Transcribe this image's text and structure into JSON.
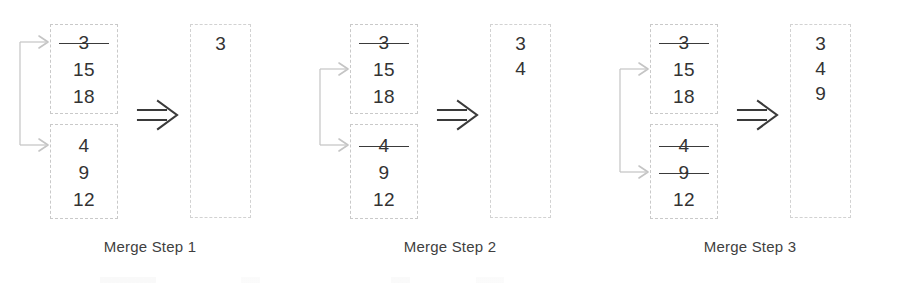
{
  "figure": {
    "colors": {
      "box_border": "#c9c9c9",
      "text": "#333333",
      "pointer": "#bdbdbd",
      "merge_arrow": "#3a3a3a",
      "caption": "#3f3f3f"
    }
  },
  "panels": [
    {
      "caption": "Merge Step 1",
      "top_stack": {
        "cells": [
          {
            "value": "3",
            "struck": true
          },
          {
            "value": "15",
            "struck": false
          },
          {
            "value": "18",
            "struck": false
          }
        ],
        "pointer_row": 0
      },
      "bottom_stack": {
        "cells": [
          {
            "value": "4",
            "struck": false
          },
          {
            "value": "9",
            "struck": false
          },
          {
            "value": "12",
            "struck": false
          }
        ],
        "pointer_row": 0
      },
      "output": {
        "cells": [
          "3"
        ]
      },
      "merge_arrow": "double-right-arrow"
    },
    {
      "caption": "Merge Step 2",
      "top_stack": {
        "cells": [
          {
            "value": "3",
            "struck": true
          },
          {
            "value": "15",
            "struck": false
          },
          {
            "value": "18",
            "struck": false
          }
        ],
        "pointer_row": 1
      },
      "bottom_stack": {
        "cells": [
          {
            "value": "4",
            "struck": true
          },
          {
            "value": "9",
            "struck": false
          },
          {
            "value": "12",
            "struck": false
          }
        ],
        "pointer_row": 0
      },
      "output": {
        "cells": [
          "3",
          "4"
        ]
      },
      "merge_arrow": "double-right-arrow"
    },
    {
      "caption": "Merge Step 3",
      "top_stack": {
        "cells": [
          {
            "value": "3",
            "struck": true
          },
          {
            "value": "15",
            "struck": false
          },
          {
            "value": "18",
            "struck": false
          }
        ],
        "pointer_row": 1
      },
      "bottom_stack": {
        "cells": [
          {
            "value": "4",
            "struck": true
          },
          {
            "value": "9",
            "struck": true
          },
          {
            "value": "12",
            "struck": false
          }
        ],
        "pointer_row": 1
      },
      "output": {
        "cells": [
          "3",
          "4",
          "9"
        ]
      },
      "merge_arrow": "double-right-arrow"
    }
  ]
}
